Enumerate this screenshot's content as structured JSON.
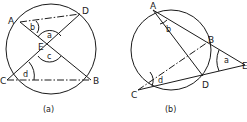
{
  "figure_a": {
    "caption": "(a)",
    "points": {
      "A": "A",
      "B": "B",
      "C": "C",
      "D": "D",
      "E": "E"
    },
    "angles": {
      "a": "a",
      "b": "b",
      "c": "c",
      "d": "d"
    }
  },
  "figure_b": {
    "caption": "(b)",
    "points": {
      "A": "A",
      "B": "B",
      "C": "C",
      "D": "D",
      "E": "E"
    },
    "angles": {
      "a": "a",
      "b": "b",
      "d": "d"
    }
  },
  "colors": {
    "stroke": "#1a1a1a",
    "background": "#ffffff"
  }
}
